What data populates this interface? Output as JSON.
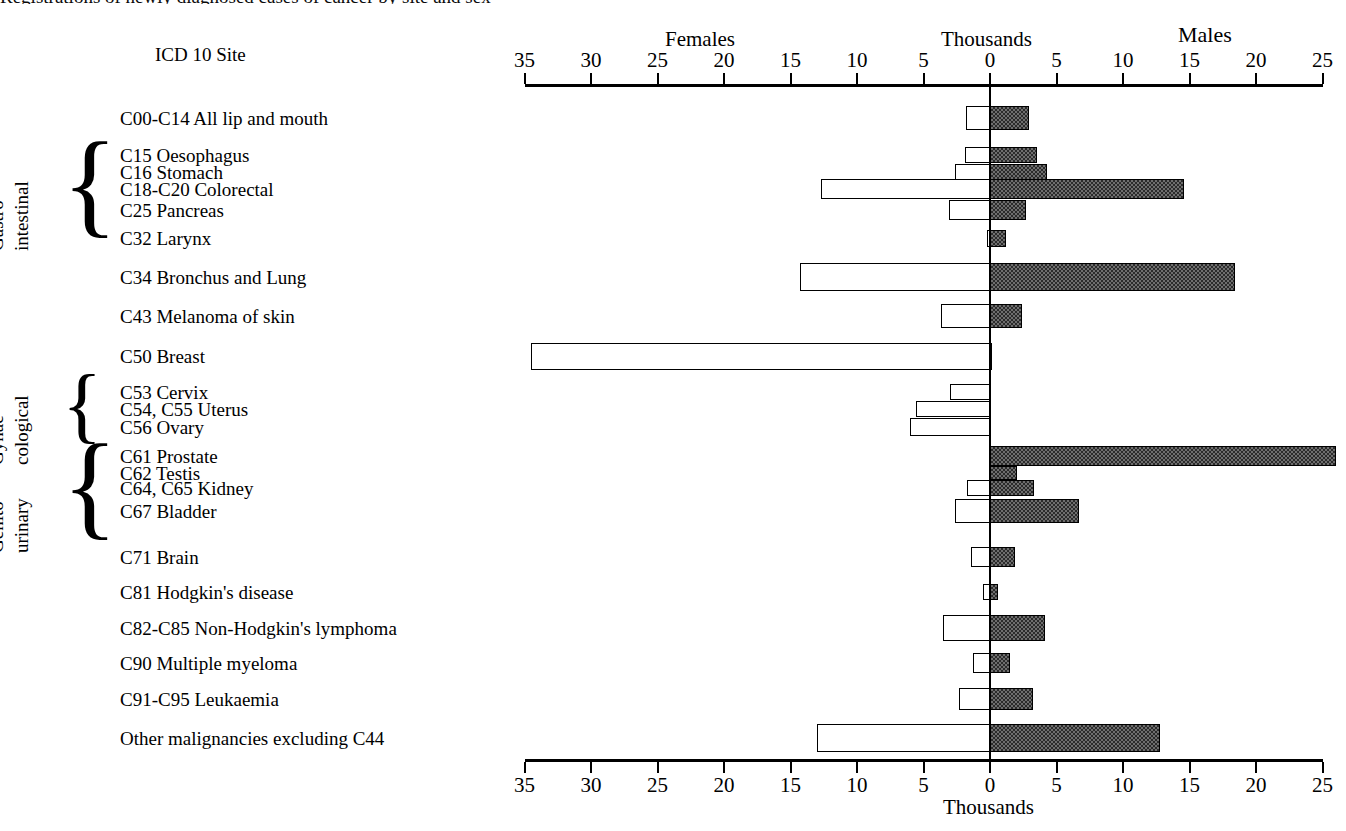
{
  "figure": {
    "cropped_title": "Registrations of newly diagnosed cases of cancer by site and sex",
    "row_header": "ICD 10 Site",
    "left_panel_label": "Females",
    "right_panel_label": "Males",
    "units_label_top": "Thousands",
    "units_label_bottom": "Thousands"
  },
  "groups": [
    {
      "name": "Gastro-\nintestinal",
      "line1": "Gastro-",
      "line2": "intestinal",
      "first": 1,
      "last": 4
    },
    {
      "name": "Gynae-\ncological",
      "line1": "Gynae-",
      "line2": "cological",
      "first": 8,
      "last": 10
    },
    {
      "name": "Genito-\nurinary",
      "line1": "Genito-",
      "line2": "urinary",
      "first": 11,
      "last": 14
    }
  ],
  "chart_data": {
    "type": "bar",
    "orientation": "horizontal",
    "style": "back-to-back population pyramid",
    "title": "Registrations of newly diagnosed cases of cancer by site and sex",
    "xlabel": "Thousands",
    "ylabel": "ICD 10 Site",
    "xlim": [
      -35,
      25
    ],
    "left_axis_direction": "Females (values increase leftward)",
    "right_axis_direction": "Males (values increase rightward)",
    "xticks": [
      35,
      30,
      25,
      20,
      15,
      10,
      5,
      0,
      5,
      10,
      15,
      20,
      25
    ],
    "grid": false,
    "legend": [
      "Females",
      "Males"
    ],
    "series": [
      {
        "name": "Females",
        "fill": "white",
        "unit": "thousands"
      },
      {
        "name": "Males",
        "fill": "hatched-grey",
        "unit": "thousands"
      }
    ],
    "categories": [
      "C00-C14 All lip and mouth",
      "C15 Oesophagus",
      "C16 Stomach",
      "C18-C20 Colorectal",
      "C25 Pancreas",
      "C32 Larynx",
      "C34 Bronchus and Lung",
      "C43 Melanoma of skin",
      "C50 Breast",
      "C53 Cervix",
      "C54, C55 Uterus",
      "C56 Ovary",
      "C61 Prostate",
      "C62 Testis",
      "C64, C65 Kidney",
      "C67 Bladder",
      "C71 Brain",
      "C81 Hodgkin's disease",
      "C82-C85 Non-Hodgkin's lymphoma",
      "C90 Multiple myeloma",
      "C91-C95 Leukaemia",
      "Other malignancies excluding C44"
    ],
    "females": [
      1.8,
      1.9,
      2.6,
      12.7,
      3.1,
      0.2,
      14.3,
      3.7,
      34.5,
      3.0,
      5.6,
      6.0,
      0.0,
      0.0,
      1.7,
      2.6,
      1.4,
      0.5,
      3.5,
      1.3,
      2.3,
      13.0
    ],
    "males": [
      2.9,
      3.5,
      4.3,
      14.6,
      2.7,
      1.2,
      18.4,
      2.4,
      0.1,
      0.0,
      0.0,
      0.0,
      26.0,
      2.0,
      3.3,
      6.7,
      1.9,
      0.6,
      4.1,
      1.5,
      3.2,
      12.8
    ]
  }
}
